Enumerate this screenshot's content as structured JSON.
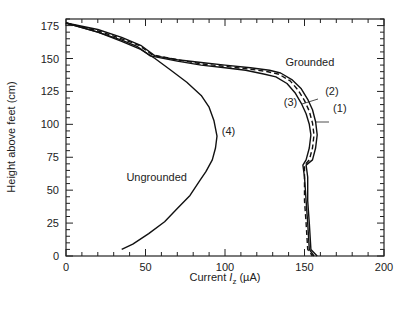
{
  "chart_data": {
    "type": "line",
    "title": "",
    "xlabel": "Current I_z (µA)",
    "xlabel_parts": {
      "prefix": "Current ",
      "italic": "I",
      "sub": "z",
      "suffix": " (µA)"
    },
    "ylabel": "Height above feet (cm)",
    "xlim": [
      0,
      200
    ],
    "ylim": [
      0,
      180
    ],
    "x_ticks": [
      0,
      50,
      100,
      150,
      200
    ],
    "y_ticks": [
      0,
      25,
      50,
      75,
      100,
      125,
      150,
      175
    ],
    "x_minor_step": 10,
    "y_minor_step": 5,
    "grid": false,
    "legend": "none (inline annotations)",
    "annotations": [
      {
        "text": "Grounded",
        "x": 138,
        "y": 144
      },
      {
        "text": "(2)",
        "x": 163,
        "y": 122
      },
      {
        "text": "(3)",
        "x": 137,
        "y": 114
      },
      {
        "text": "(1)",
        "x": 168,
        "y": 109
      },
      {
        "text": "(4)",
        "x": 98,
        "y": 92
      },
      {
        "text": "Ungrounded",
        "x": 38,
        "y": 57
      }
    ],
    "series": [
      {
        "name": "(1)",
        "group": "Grounded",
        "style": "solid",
        "points": [
          [
            0,
            177
          ],
          [
            20,
            172
          ],
          [
            35,
            166
          ],
          [
            47,
            160
          ],
          [
            56,
            152
          ],
          [
            70,
            149
          ],
          [
            85,
            147
          ],
          [
            100,
            145
          ],
          [
            116,
            143
          ],
          [
            128,
            141
          ],
          [
            135,
            139
          ],
          [
            142,
            134
          ],
          [
            148,
            127
          ],
          [
            152,
            119
          ],
          [
            155,
            111
          ],
          [
            157,
            102
          ],
          [
            158,
            92
          ],
          [
            157,
            82
          ],
          [
            155,
            73
          ],
          [
            151,
            69
          ],
          [
            152,
            60
          ],
          [
            152,
            42
          ],
          [
            153,
            25
          ],
          [
            154,
            5
          ],
          [
            158,
            0
          ]
        ]
      },
      {
        "name": "(2)",
        "group": "Grounded",
        "style": "dashed",
        "points": [
          [
            0,
            177
          ],
          [
            20,
            171
          ],
          [
            35,
            165
          ],
          [
            46,
            160
          ],
          [
            54,
            153
          ],
          [
            70,
            149
          ],
          [
            85,
            146
          ],
          [
            100,
            144
          ],
          [
            115,
            142
          ],
          [
            127,
            140
          ],
          [
            134,
            138
          ],
          [
            141,
            133
          ],
          [
            146,
            126
          ],
          [
            150,
            118
          ],
          [
            153,
            110
          ],
          [
            155,
            101
          ],
          [
            156,
            92
          ],
          [
            155,
            82
          ],
          [
            153,
            73
          ],
          [
            150,
            69
          ],
          [
            150,
            60
          ],
          [
            150,
            42
          ],
          [
            151,
            25
          ],
          [
            152,
            5
          ],
          [
            155,
            0
          ]
        ]
      },
      {
        "name": "(3)",
        "group": "Grounded",
        "style": "solid",
        "points": [
          [
            0,
            177
          ],
          [
            20,
            170
          ],
          [
            35,
            164
          ],
          [
            45,
            159
          ],
          [
            53,
            152
          ],
          [
            70,
            148
          ],
          [
            85,
            145
          ],
          [
            100,
            143
          ],
          [
            113,
            141
          ],
          [
            125,
            138
          ],
          [
            132,
            136
          ],
          [
            139,
            131
          ],
          [
            144,
            124
          ],
          [
            148,
            116
          ],
          [
            151,
            108
          ],
          [
            153,
            100
          ],
          [
            154,
            92
          ],
          [
            153,
            82
          ],
          [
            151,
            73
          ],
          [
            149,
            69
          ],
          [
            150,
            60
          ],
          [
            151,
            42
          ],
          [
            152,
            25
          ],
          [
            153,
            5
          ],
          [
            156,
            0
          ]
        ]
      },
      {
        "name": "(4)",
        "group": "Ungrounded",
        "style": "solid",
        "points": [
          [
            0,
            177
          ],
          [
            20,
            170
          ],
          [
            35,
            163
          ],
          [
            47,
            157
          ],
          [
            56,
            150
          ],
          [
            66,
            141
          ],
          [
            76,
            132
          ],
          [
            85,
            122
          ],
          [
            90,
            113
          ],
          [
            93,
            103
          ],
          [
            95,
            91
          ],
          [
            94,
            82
          ],
          [
            92,
            73
          ],
          [
            88,
            64
          ],
          [
            84,
            57
          ],
          [
            78,
            46
          ],
          [
            70,
            36
          ],
          [
            62,
            26
          ],
          [
            52,
            17
          ],
          [
            42,
            9
          ],
          [
            35,
            5
          ]
        ]
      }
    ]
  }
}
